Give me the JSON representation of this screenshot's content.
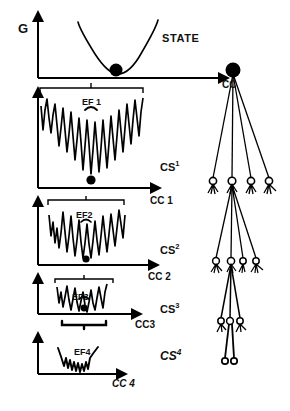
{
  "figure": {
    "title_text": "STATE",
    "y_axis_label": "G",
    "panels": [
      {
        "id": "panel-0",
        "level_label": "STATE",
        "x_axis_label": "CC",
        "energy_label": "",
        "well_count": 1,
        "description": "smooth parabolic potential with ball at minimum"
      },
      {
        "id": "panel-1",
        "level_label": "CS",
        "level_superscript": "1",
        "x_axis_label": "CC 1",
        "energy_label": "EF 1",
        "well_count": 9,
        "description": "rugged landscape, many deep narrow wells"
      },
      {
        "id": "panel-2",
        "level_label": "CS",
        "level_superscript": "2",
        "x_axis_label": "CC 2",
        "energy_label": "EF2",
        "well_count": 7,
        "description": "narrower funnel landscape"
      },
      {
        "id": "panel-3",
        "level_label": "CS",
        "level_superscript": "3",
        "x_axis_label": "CC3",
        "energy_label": "EF3",
        "well_count": 5,
        "description": "small rugged well"
      },
      {
        "id": "panel-4",
        "level_label": "CS",
        "level_superscript": "4",
        "x_axis_label": "CC 4",
        "energy_label": "EF4",
        "well_count": 3,
        "description": "shallow single basin with fine structure"
      }
    ],
    "tree": {
      "description": "hierarchical substate tree",
      "levels": [
        {
          "node_count": 1,
          "node_style": "filled"
        },
        {
          "node_count": 4,
          "node_style": "open"
        },
        {
          "node_count": 4,
          "node_style": "open"
        },
        {
          "node_count": 3,
          "node_style": "open"
        },
        {
          "node_count": 2,
          "node_style": "open"
        }
      ]
    },
    "colors": {
      "ink": "#000000",
      "background": "#ffffff"
    }
  }
}
